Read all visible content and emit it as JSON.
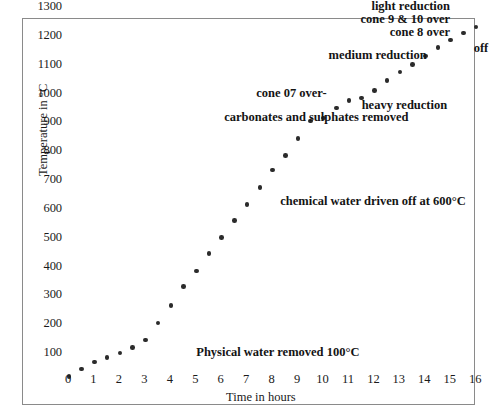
{
  "chart_data": {
    "type": "scatter",
    "title": "",
    "xlabel": "Time in hours",
    "ylabel": "Temperature in °C",
    "xlim": [
      0,
      16.6
    ],
    "ylim": [
      0,
      1330
    ],
    "grid": false,
    "legend": "none",
    "marker": "filled-circle",
    "marker_color": "#2b2b2b",
    "x_ticks": [
      "0",
      "1",
      "2",
      "3",
      "4",
      "5",
      "6",
      "7",
      "8",
      "9",
      "10",
      "11",
      "12",
      "13",
      "14",
      "15",
      "16"
    ],
    "y_ticks": [
      "100",
      "200",
      "300",
      "400",
      "500",
      "600",
      "700",
      "800",
      "900",
      "1000",
      "1100",
      "1200",
      "1300"
    ],
    "series": [
      {
        "name": "kiln firing schedule",
        "x": [
          0,
          0.5,
          1,
          1.5,
          2,
          2.5,
          3,
          3.5,
          4,
          4.5,
          5,
          5.5,
          6,
          6.5,
          7,
          7.5,
          8,
          8.5,
          9,
          9.5,
          10,
          10.5,
          11,
          11.5,
          12,
          12.5,
          13,
          13.5,
          14,
          14.5,
          15,
          15.5,
          16
        ],
        "y": [
          20,
          45,
          70,
          85,
          100,
          120,
          145,
          205,
          265,
          330,
          385,
          445,
          500,
          560,
          615,
          675,
          735,
          785,
          845,
          905,
          915,
          950,
          975,
          985,
          1010,
          1045,
          1075,
          1100,
          1130,
          1160,
          1185,
          1210,
          1230
        ]
      }
    ],
    "annotations": [
      {
        "id": "light-reduction",
        "text": "light reduction",
        "x": 13.2,
        "y": 1300
      },
      {
        "id": "cone-9-10-over",
        "text": "cone 9 & 10 over",
        "x": 13.0,
        "y": 1255
      },
      {
        "id": "cone-8-over",
        "text": "cone 8 over",
        "x": 13.4,
        "y": 1210
      },
      {
        "id": "off",
        "text": "off",
        "x": 15.9,
        "y": 1155
      },
      {
        "id": "medium-reduction",
        "text": "medium reduction",
        "x": 10.2,
        "y": 1130
      },
      {
        "id": "cone-07-over",
        "text": "cone 07 over-",
        "x": 8.9,
        "y": 1000
      },
      {
        "id": "heavy-reduction",
        "text": "heavy reduction",
        "x": 11.5,
        "y": 955
      },
      {
        "id": "carbonates-sulphates",
        "text": "carbonates and sulphates removed",
        "x": 6.1,
        "y": 915
      },
      {
        "id": "chemical-water",
        "text": "chemical water driven off at 600°C",
        "x": 8.3,
        "y": 625
      },
      {
        "id": "physical-water",
        "text": "Physical water removed 100°C",
        "x": 5.0,
        "y": 100
      }
    ]
  },
  "caption": ""
}
